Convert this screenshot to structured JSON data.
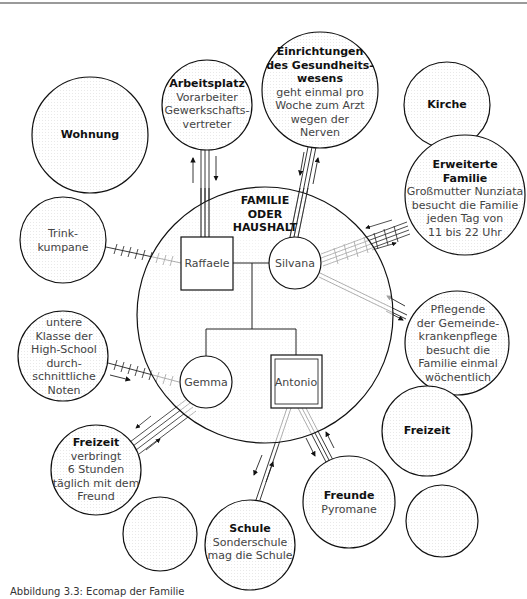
{
  "diagram": {
    "type": "ecomap",
    "center": {
      "title_lines": [
        "FAMILIE",
        "ODER",
        "HAUSHALT"
      ],
      "members": {
        "father": "Raffaele",
        "mother": "Silvana",
        "daughter": "Gemma",
        "son": "Antonio"
      }
    },
    "nodes": {
      "wohnung": {
        "title": "Wohnung",
        "lines": []
      },
      "arbeitsplatz": {
        "title": "Arbeitsplatz",
        "lines": [
          "Vorarbeiter",
          "Gewerkschafts-",
          "vertreter"
        ]
      },
      "gesundheit": {
        "title_lines": [
          "Einrichtungen",
          "des Gesundheits-",
          "wesens"
        ],
        "lines": [
          "geht einmal pro",
          "Woche  zum Arzt",
          "wegen der",
          "Nerven"
        ]
      },
      "kirche": {
        "title": "Kirche",
        "lines": []
      },
      "erweiterte_familie": {
        "title_lines": [
          "Erweiterte",
          "Familie"
        ],
        "lines": [
          "Großmutter Nunziata",
          "besucht die Familie",
          "jeden Tag von",
          "11 bis 22 Uhr"
        ]
      },
      "trinkkumpane": {
        "lines": [
          "Trink-",
          "kumpane"
        ]
      },
      "pflege": {
        "lines": [
          "Pflegende",
          "der Gemeinde-",
          "krankenpflege",
          "besucht die",
          "Familie einmal",
          "wöchentlich"
        ]
      },
      "schule_gemma": {
        "lines": [
          "untere",
          "Klasse der",
          "High-School",
          "durch-",
          "schnittliche",
          "Noten"
        ]
      },
      "freizeit_gemma": {
        "title": "Freizeit",
        "lines": [
          "verbringt",
          "6 Stunden",
          "täglich mit dem",
          "Freund"
        ]
      },
      "freizeit_right": {
        "title": "Freizeit",
        "lines": []
      },
      "schule_antonio": {
        "title": "Schule",
        "lines": [
          "Sonderschule",
          "mag die Schule"
        ]
      },
      "freunde": {
        "title": "Freunde",
        "lines": [
          "Pyromane"
        ]
      },
      "empty_left": {
        "lines": []
      },
      "empty_right": {
        "lines": []
      }
    },
    "caption": "Abbildung 3.3: Ecomap der Familie"
  }
}
